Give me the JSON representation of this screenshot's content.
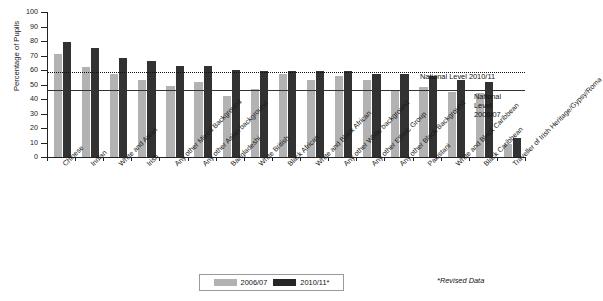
{
  "chart_data": {
    "type": "bar",
    "title": "",
    "xlabel": "",
    "ylabel": "Percentage of Pupils",
    "ylim": [
      0,
      100
    ],
    "yticks": [
      0,
      10,
      20,
      30,
      40,
      50,
      60,
      70,
      80,
      90,
      100
    ],
    "grid": false,
    "legend_position": "bottom-center",
    "categories": [
      "Chinese",
      "Indian",
      "White and Asian",
      "Irish",
      "Any other Mixed Background",
      "Any other Asian background",
      "Bangladeshi",
      "White British",
      "Black African",
      "White and Black African",
      "Any other White background",
      "Any other Ethnic Group",
      "Any other Black Background",
      "Pakistani",
      "White and Black Caribbean",
      "Black Caribbean",
      "Traveller of Irish Heritage/Gypsy/Roma"
    ],
    "series": [
      {
        "name": "2006/07",
        "color": "#b2b2b2",
        "values": [
          71,
          62,
          57,
          53,
          49,
          52,
          42,
          47,
          57,
          53,
          56,
          53,
          46,
          48,
          45,
          44,
          9
        ]
      },
      {
        "name": "2010/11*",
        "color": "#323232",
        "values": [
          79,
          75,
          68,
          66,
          63,
          63,
          60,
          59,
          59,
          59,
          59,
          57,
          57,
          56,
          53,
          52,
          13
        ]
      }
    ],
    "annotations": [
      {
        "name": "national-level-2010-11",
        "label": "National Level 2010/11",
        "value": 58.5,
        "line_style": "dotted"
      },
      {
        "name": "national-level-2006-07",
        "label": "National Level 2006/07",
        "value": 46.5,
        "line_style": "solid"
      }
    ],
    "footnote": "*Revised Data"
  },
  "legend": {
    "items": [
      {
        "label": "2006/07",
        "color": "#b2b2b2"
      },
      {
        "label": "2010/11*",
        "color": "#262626"
      }
    ]
  },
  "annotation_text": {
    "national_2010_11": "National Level 2010/11",
    "national_2006_07_line1": "National",
    "national_2006_07_line2": "Level",
    "national_2006_07_line3": "2006/07"
  }
}
